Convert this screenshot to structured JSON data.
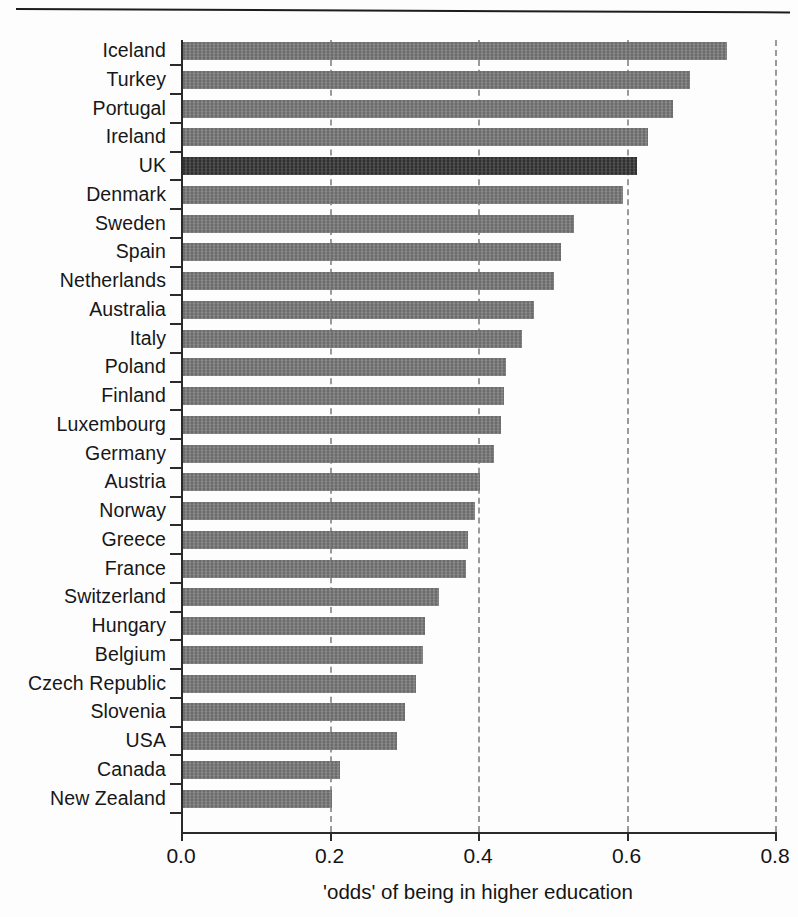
{
  "figure": {
    "top_rule": true,
    "background": "#fdfdfd"
  },
  "colors": {
    "bar": "#757575",
    "highlight_bar": "#343434",
    "axis": "#2a2a2a",
    "gridline": "#9a9a9a",
    "text": "#141414"
  },
  "axis": {
    "x_title": "'odds' of being in higher education",
    "x_ticks": [
      "0.0",
      "0.2",
      "0.4",
      "0.6",
      "0.8"
    ],
    "x_tick_values": [
      0.0,
      0.2,
      0.4,
      0.6,
      0.8
    ]
  },
  "chart_data": {
    "type": "bar",
    "orientation": "horizontal",
    "title": "",
    "xlabel": "'odds' of being in higher education",
    "ylabel": "",
    "xlim": [
      0.0,
      0.8
    ],
    "grid": "vertical dashed gridlines at 0.2, 0.4, 0.6, 0.8",
    "legend": "none",
    "highlight_category": "UK",
    "categories": [
      "Iceland",
      "Turkey",
      "Portugal",
      "Ireland",
      "UK",
      "Denmark",
      "Sweden",
      "Spain",
      "Netherlands",
      "Australia",
      "Italy",
      "Poland",
      "Finland",
      "Luxembourg",
      "Germany",
      "Austria",
      "Norway",
      "Greece",
      "France",
      "Switzerland",
      "Hungary",
      "Belgium",
      "Czech Republic",
      "Slovenia",
      "USA",
      "Canada",
      "New Zealand"
    ],
    "values": [
      0.735,
      0.685,
      0.662,
      0.629,
      0.614,
      0.595,
      0.529,
      0.512,
      0.503,
      0.475,
      0.459,
      0.438,
      0.435,
      0.431,
      0.421,
      0.403,
      0.396,
      0.386,
      0.384,
      0.347,
      0.329,
      0.326,
      0.316,
      0.302,
      0.291,
      0.214,
      0.203
    ]
  }
}
